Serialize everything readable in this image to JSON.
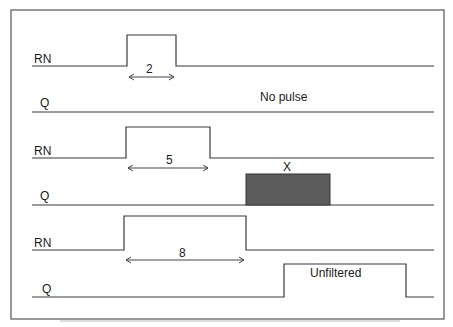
{
  "diagram": {
    "type": "timing-diagram",
    "frame": {
      "stroke": "#555555"
    },
    "colors": {
      "line": "#3a3a3a",
      "unknown_fill": "#5c5c5c"
    },
    "rows": [
      {
        "id": "rn1",
        "signal": "RN",
        "pulse_label": "2"
      },
      {
        "id": "q1",
        "signal": "Q",
        "annotation": "No pulse"
      },
      {
        "id": "rn2",
        "signal": "RN",
        "pulse_label": "5"
      },
      {
        "id": "q2",
        "signal": "Q",
        "annotation": "X"
      },
      {
        "id": "rn3",
        "signal": "RN",
        "pulse_label": "8"
      },
      {
        "id": "q3",
        "signal": "Q",
        "annotation": "Unfiltered"
      }
    ]
  }
}
